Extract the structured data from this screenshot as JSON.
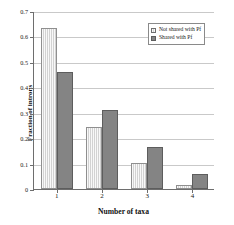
{
  "chart_data": {
    "type": "bar",
    "title": "",
    "xlabel": "Number of taxa",
    "ylabel": "Fraction of introns",
    "categories": [
      "1",
      "2",
      "3",
      "4"
    ],
    "series": [
      {
        "name": "Not shared with Pf",
        "color": "#d2d2d2",
        "values": [
          0.632,
          0.245,
          0.103,
          0.015
        ]
      },
      {
        "name": "Shared with Pf",
        "color": "#848484",
        "values": [
          0.461,
          0.311,
          0.166,
          0.058
        ]
      }
    ],
    "ylim": [
      0,
      0.7
    ],
    "yticks": [
      0,
      0.1,
      0.2,
      0.3,
      0.4,
      0.5,
      0.6,
      0.7
    ],
    "ytick_labels": [
      "0",
      "0.1",
      "0.2",
      "0.3",
      "0.4",
      "0.5",
      "0.6",
      "0.7"
    ],
    "grid": true,
    "grid_axis": "y",
    "legend_position": "top-right"
  }
}
